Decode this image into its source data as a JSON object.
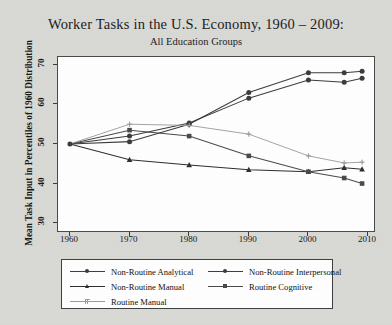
{
  "chart_data": {
    "type": "line",
    "title": "Worker Tasks in the U.S. Economy, 1960 – 2009:",
    "subtitle": "All Education Groups",
    "xlabel": "",
    "ylabel": "Mean Task Input in Percentiles of 1960 Distribution",
    "xlim": [
      1958,
      2011
    ],
    "ylim": [
      28,
      72
    ],
    "xticks": [
      "1960",
      "1970",
      "1980",
      "1990",
      "2000",
      "2010"
    ],
    "xtick_values": [
      1960,
      1970,
      1980,
      1990,
      2000,
      2010
    ],
    "yticks": [
      "30",
      "40",
      "50",
      "60",
      "70"
    ],
    "ytick_values": [
      30,
      40,
      50,
      60,
      70
    ],
    "grid": false,
    "legend_position": "below-plot",
    "x": [
      1960,
      1970,
      1980,
      1990,
      2000,
      2006,
      2009
    ],
    "series": [
      {
        "name": "Non-Routine Analytical",
        "marker": "circle",
        "color": "#3c3c3c",
        "values": [
          50.0,
          52.0,
          55.3,
          61.6,
          66.2,
          65.6,
          66.6
        ]
      },
      {
        "name": "Non-Routine Interpersonal",
        "marker": "circle",
        "color": "#3c3c3c",
        "values": [
          50.0,
          50.6,
          55.0,
          63.0,
          68.0,
          68.0,
          68.4
        ]
      },
      {
        "name": "Non-Routine Manual",
        "marker": "triangle",
        "color": "#2e2e2e",
        "values": [
          50.0,
          46.0,
          44.7,
          43.5,
          43.0,
          44.0,
          43.6
        ]
      },
      {
        "name": "Routine Cognitive",
        "marker": "square",
        "color": "#4a4a4a",
        "values": [
          50.0,
          53.5,
          52.0,
          47.0,
          43.0,
          41.4,
          40.0
        ]
      },
      {
        "name": "Routine Manual",
        "marker": "plus",
        "color": "#9a9a9a",
        "values": [
          50.0,
          55.0,
          54.7,
          52.5,
          47.0,
          45.2,
          45.4
        ]
      }
    ]
  },
  "legend": {
    "items": [
      {
        "label": "Non-Routine Analytical"
      },
      {
        "label": "Non-Routine Interpersonal"
      },
      {
        "label": "Non-Routine Manual"
      },
      {
        "label": "Routine Cognitive"
      },
      {
        "label": "Routine Manual"
      }
    ]
  }
}
